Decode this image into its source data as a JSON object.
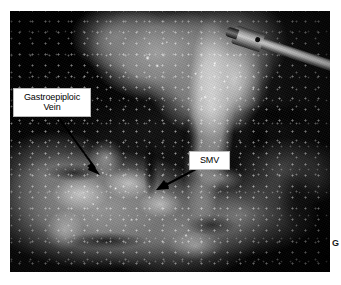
{
  "figure": {
    "panel_letter": "G",
    "photo": {
      "kind": "intraoperative-photograph",
      "modality": "open/laparoscopic surgical field",
      "color_mode": "grayscale",
      "background_color": "#ffffff",
      "frame": {
        "x": 10,
        "y": 11,
        "width": 320,
        "height": 261
      }
    },
    "annotations": [
      {
        "id": "gastroepiploic-vein",
        "line1": "Gastroepiploic",
        "line2": "Vein",
        "box": {
          "x": 13,
          "y": 88,
          "width": 72,
          "height": 27
        },
        "arrow": {
          "from_x": 58,
          "from_y": 117,
          "to_x": 99,
          "to_y": 173
        }
      },
      {
        "id": "smv",
        "line1": "SMV",
        "line2": "",
        "box": {
          "x": 189,
          "y": 151,
          "width": 35,
          "height": 17
        },
        "arrow": {
          "from_x": 196,
          "from_y": 169,
          "to_x": 157,
          "to_y": 190
        }
      }
    ],
    "instrument": {
      "name": "metallic-surgical-instrument",
      "location": "upper-right"
    },
    "colors": {
      "label_background": "#ffffff",
      "label_text": "#000000",
      "label_border": "#b9b9b9",
      "arrow": "#000000",
      "page_background": "#ffffff"
    }
  }
}
